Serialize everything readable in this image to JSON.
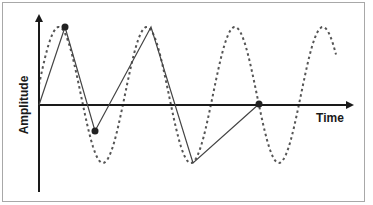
{
  "diagram": {
    "title": "",
    "axes": {
      "x_label": "Time",
      "y_label": "Amplitude"
    },
    "colors": {
      "axis": "#1a1a1a",
      "signal": "#555555",
      "samples": "#333333",
      "frame": "#a8a8a8"
    },
    "signal": {
      "style": "dashed",
      "shape": "sine",
      "cycles_visible": 3.5
    },
    "sampled_reconstruction": {
      "style": "solid",
      "points": [
        {
          "x": 39,
          "y": 105
        },
        {
          "x": 65,
          "y": 27
        },
        {
          "x": 95,
          "y": 131
        },
        {
          "x": 151,
          "y": 27
        },
        {
          "x": 193,
          "y": 163
        },
        {
          "x": 259,
          "y": 104
        }
      ],
      "sample_dots": [
        {
          "x": 65,
          "y": 27
        },
        {
          "x": 95,
          "y": 131
        },
        {
          "x": 259,
          "y": 104
        }
      ]
    }
  }
}
